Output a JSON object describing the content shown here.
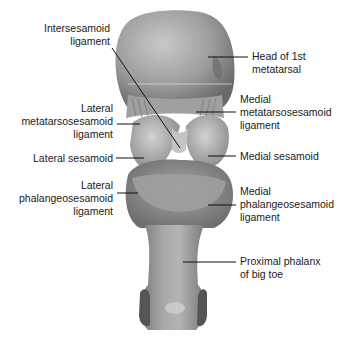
{
  "diagram": {
    "colors": {
      "bone_base": "#9a9a9a",
      "bone_light": "#c8c8c8",
      "bone_dark": "#5e5e5e",
      "leader_line": "#111111",
      "text": "#1a1a1a"
    },
    "labels_left": [
      {
        "id": "intersesamoid",
        "text": "Intersesamoid\nligament"
      },
      {
        "id": "lateral-metatarsosesamoid",
        "text": "Lateral\nmetatarsosesamoid\nligament"
      },
      {
        "id": "lateral-sesamoid",
        "text": "Lateral sesamoid"
      },
      {
        "id": "lateral-phalangeosesamoid",
        "text": "Lateral\nphalangeosesamoid\nligament"
      }
    ],
    "labels_right": [
      {
        "id": "head-1st-metatarsal",
        "text": "Head of 1st\nmetatarsal"
      },
      {
        "id": "medial-metatarsosesamoid",
        "text": "Medial\nmetatarsosesamoid\nligament"
      },
      {
        "id": "medial-sesamoid",
        "text": "Medial sesamoid"
      },
      {
        "id": "medial-phalangeosesamoid",
        "text": "Medial\nphalangeosesamoid\nligament"
      },
      {
        "id": "proximal-phalanx",
        "text": "Proximal phalanx\nof big toe"
      }
    ]
  }
}
